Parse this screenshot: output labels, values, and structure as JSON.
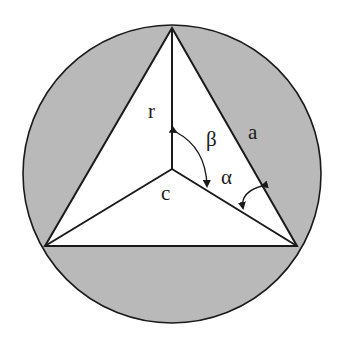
{
  "diagram": {
    "colors": {
      "background": "#ffffff",
      "circle_fill": "#b9b9b9",
      "triangle_fill": "#ffffff",
      "stroke": "#1a1a1a"
    },
    "circle": {
      "cx": 172,
      "cy": 174,
      "r": 149
    },
    "vertices": {
      "top": [
        172,
        28
      ],
      "bottom_left": [
        45,
        246
      ],
      "bottom_right": [
        297,
        246
      ]
    },
    "center": [
      172,
      169
    ],
    "labels": {
      "r": "r",
      "a": "a",
      "c": "c",
      "alpha": "α",
      "beta": "β"
    }
  }
}
